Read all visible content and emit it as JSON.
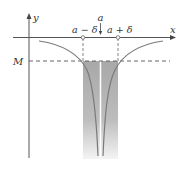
{
  "diagram": {
    "axes": {
      "x_label": "x",
      "y_label": "y"
    },
    "labels": {
      "a": "a",
      "a_minus_delta": "a − δ",
      "a_plus_delta": "a + δ",
      "M": "M"
    },
    "colors": {
      "axis": "#555555",
      "curve": "#777777",
      "shade_top": "#aaaaaa",
      "shade_bottom": "#eeeeee"
    }
  }
}
